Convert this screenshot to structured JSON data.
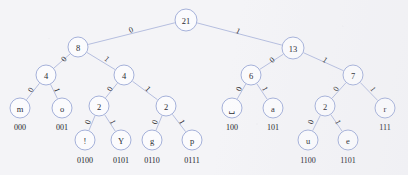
{
  "diagram": {
    "type": "huffman-coding-tree",
    "title": "",
    "background_color": "#f4f4f7",
    "node_stroke_color": "#8f9ed0",
    "edge_color": "#9aa6d4",
    "text_color": "#2b2b33"
  },
  "nodes": [
    {
      "id": "root",
      "label": "21",
      "kind": "internal",
      "x": 186,
      "y": 20,
      "r": 11
    },
    {
      "id": "n8",
      "label": "8",
      "kind": "internal",
      "x": 78,
      "y": 47,
      "r": 10
    },
    {
      "id": "n13",
      "label": "13",
      "kind": "internal",
      "x": 293,
      "y": 48,
      "r": 11
    },
    {
      "id": "n4a",
      "label": "4",
      "kind": "internal",
      "x": 46,
      "y": 75,
      "r": 10
    },
    {
      "id": "n4b",
      "label": "4",
      "kind": "internal",
      "x": 124,
      "y": 75,
      "r": 10
    },
    {
      "id": "n6",
      "label": "6",
      "kind": "internal",
      "x": 251,
      "y": 75,
      "r": 10
    },
    {
      "id": "n7",
      "label": "7",
      "kind": "internal",
      "x": 353,
      "y": 75,
      "r": 10
    },
    {
      "id": "lm",
      "label": "m",
      "kind": "leaf",
      "x": 20,
      "y": 108,
      "r": 10,
      "code": "000"
    },
    {
      "id": "lo",
      "label": "o",
      "kind": "leaf",
      "x": 62,
      "y": 108,
      "r": 10,
      "code": "001"
    },
    {
      "id": "n2a",
      "label": "2",
      "kind": "internal",
      "x": 99,
      "y": 106,
      "r": 10
    },
    {
      "id": "n2b",
      "label": "2",
      "kind": "internal",
      "x": 166,
      "y": 106,
      "r": 10
    },
    {
      "id": "lsp",
      "label": "␣",
      "kind": "leaf",
      "x": 232,
      "y": 108,
      "r": 10,
      "code": "100"
    },
    {
      "id": "la",
      "label": "a",
      "kind": "leaf",
      "x": 273,
      "y": 108,
      "r": 10,
      "code": "101"
    },
    {
      "id": "n2c",
      "label": "2",
      "kind": "internal",
      "x": 325,
      "y": 106,
      "r": 10
    },
    {
      "id": "lr",
      "label": "r",
      "kind": "leaf",
      "x": 385,
      "y": 108,
      "r": 10,
      "code": "111"
    },
    {
      "id": "lex",
      "label": "!",
      "kind": "leaf",
      "x": 85,
      "y": 140,
      "r": 10,
      "code": "0100"
    },
    {
      "id": "lY",
      "label": "Y",
      "kind": "leaf",
      "x": 121,
      "y": 140,
      "r": 10,
      "code": "0101"
    },
    {
      "id": "lg",
      "label": "g",
      "kind": "leaf",
      "x": 152,
      "y": 140,
      "r": 10,
      "code": "0110"
    },
    {
      "id": "lp",
      "label": "p",
      "kind": "leaf",
      "x": 192,
      "y": 140,
      "r": 10,
      "code": "0111"
    },
    {
      "id": "lu",
      "label": "u",
      "kind": "leaf",
      "x": 308,
      "y": 140,
      "r": 10,
      "code": "1100"
    },
    {
      "id": "le",
      "label": "e",
      "kind": "leaf",
      "x": 348,
      "y": 140,
      "r": 10,
      "code": "1101"
    }
  ],
  "edges": [
    {
      "from": "root",
      "to": "n8",
      "label": "0",
      "lx": 131,
      "ly": 30
    },
    {
      "from": "root",
      "to": "n13",
      "label": "1",
      "lx": 238,
      "ly": 31
    },
    {
      "from": "n8",
      "to": "n4a",
      "label": "0",
      "lx": 64,
      "ly": 59
    },
    {
      "from": "n8",
      "to": "n4b",
      "label": "1",
      "lx": 107,
      "ly": 59
    },
    {
      "from": "n13",
      "to": "n6",
      "label": "0",
      "lx": 272,
      "ly": 60
    },
    {
      "from": "n13",
      "to": "n7",
      "label": "1",
      "lx": 325,
      "ly": 60
    },
    {
      "from": "n4a",
      "to": "lm",
      "label": "0",
      "lx": 31,
      "ly": 90
    },
    {
      "from": "n4a",
      "to": "lo",
      "label": "1",
      "lx": 57,
      "ly": 90
    },
    {
      "from": "n4b",
      "to": "n2a",
      "label": "0",
      "lx": 110,
      "ly": 89
    },
    {
      "from": "n4b",
      "to": "n2b",
      "label": "1",
      "lx": 148,
      "ly": 89
    },
    {
      "from": "n6",
      "to": "lsp",
      "label": "0",
      "lx": 239,
      "ly": 89
    },
    {
      "from": "n6",
      "to": "la",
      "label": "1",
      "lx": 265,
      "ly": 89
    },
    {
      "from": "n7",
      "to": "n2c",
      "label": "0",
      "lx": 336,
      "ly": 89
    },
    {
      "from": "n7",
      "to": "lr",
      "label": "1",
      "lx": 373,
      "ly": 89
    },
    {
      "from": "n2a",
      "to": "lex",
      "label": "0",
      "lx": 88,
      "ly": 122
    },
    {
      "from": "n2a",
      "to": "lY",
      "label": "1",
      "lx": 113,
      "ly": 122
    },
    {
      "from": "n2b",
      "to": "lg",
      "label": "0",
      "lx": 155,
      "ly": 122
    },
    {
      "from": "n2b",
      "to": "lp",
      "label": "1",
      "lx": 182,
      "ly": 122
    },
    {
      "from": "n2c",
      "to": "lu",
      "label": "0",
      "lx": 311,
      "ly": 122
    },
    {
      "from": "n2c",
      "to": "le",
      "label": "1",
      "lx": 338,
      "ly": 122
    }
  ],
  "codes": [
    {
      "symbol": "m",
      "code": "000",
      "x": 20,
      "y": 127
    },
    {
      "symbol": "o",
      "code": "001",
      "x": 62,
      "y": 127
    },
    {
      "symbol": "␣",
      "code": "100",
      "x": 232,
      "y": 127
    },
    {
      "symbol": "a",
      "code": "101",
      "x": 273,
      "y": 127
    },
    {
      "symbol": "r",
      "code": "111",
      "x": 385,
      "y": 127
    },
    {
      "symbol": "!",
      "code": "0100",
      "x": 85,
      "y": 160
    },
    {
      "symbol": "Y",
      "code": "0101",
      "x": 121,
      "y": 160
    },
    {
      "symbol": "g",
      "code": "0110",
      "x": 152,
      "y": 160
    },
    {
      "symbol": "p",
      "code": "0111",
      "x": 192,
      "y": 160
    },
    {
      "symbol": "u",
      "code": "1100",
      "x": 308,
      "y": 160
    },
    {
      "symbol": "e",
      "code": "1101",
      "x": 348,
      "y": 160
    }
  ]
}
